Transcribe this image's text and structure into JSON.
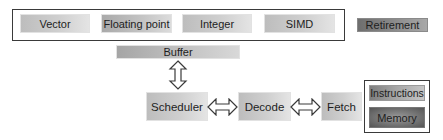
{
  "execution_units": {
    "units": [
      {
        "label": "Vector"
      },
      {
        "label": "Floating point"
      },
      {
        "label": "Integer"
      },
      {
        "label": "SIMD"
      }
    ]
  },
  "retirement": {
    "label": "Retirement"
  },
  "buffer": {
    "label": "Buffer"
  },
  "pipeline": {
    "scheduler": {
      "label": "Scheduler"
    },
    "decode": {
      "label": "Decode"
    },
    "fetch": {
      "label": "Fetch"
    }
  },
  "memory_block": {
    "instructions": {
      "label": "Instructions"
    },
    "memory": {
      "label": "Memory"
    }
  },
  "connectors": [
    {
      "from": "Buffer",
      "to": "Scheduler",
      "type": "bidirectional-vertical-arrow"
    },
    {
      "from": "Scheduler",
      "to": "Decode",
      "type": "bidirectional-horizontal-arrow"
    },
    {
      "from": "Decode",
      "to": "Fetch",
      "type": "bidirectional-horizontal-arrow"
    }
  ]
}
